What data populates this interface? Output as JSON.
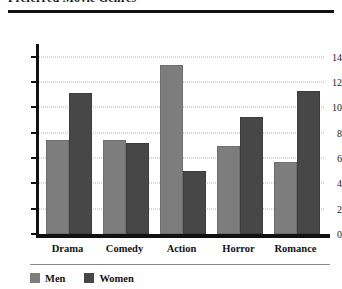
{
  "figure": {
    "title_partial": "Preferred Movie Genres",
    "has_top_rule": true,
    "has_mid_rule": true
  },
  "chart_data": {
    "type": "bar",
    "title": "Preferred Movie Genres",
    "xlabel": "",
    "ylabel": "",
    "categories": [
      "Drama",
      "Comedy",
      "Action",
      "Horror",
      "Romance"
    ],
    "series": [
      {
        "name": "Men",
        "color": "#7d7d7d",
        "values": [
          7.3,
          7.3,
          13.2,
          6.8,
          5.5
        ]
      },
      {
        "name": "Women",
        "color": "#474747",
        "values": [
          11.0,
          7.0,
          4.8,
          9.1,
          11.1
        ]
      }
    ],
    "ylim": [
      0,
      15
    ],
    "yticks": [
      0,
      2,
      4,
      6,
      8,
      10,
      12,
      14
    ],
    "ytick_labels": [
      "0",
      "2",
      "4",
      "6",
      "8",
      "10",
      "12",
      "14"
    ],
    "grid": true,
    "grid_style": "dotted",
    "grid_axis": "y",
    "legend_position": "bottom-left",
    "background": "#ffffff"
  }
}
